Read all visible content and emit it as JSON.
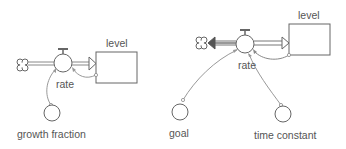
{
  "colors": {
    "stroke": "#666666",
    "flow_pipe": "#888888",
    "outflow_pipe": "#777777",
    "connector": "#999999",
    "text": "#555555",
    "background": "#ffffff"
  },
  "models": [
    {
      "name": "exponential growth",
      "stock": {
        "label": "level"
      },
      "flow": {
        "label": "rate",
        "direction": "inflow",
        "source": "cloud"
      },
      "auxiliaries": [
        {
          "label": "growth fraction"
        }
      ],
      "links": [
        "level -> rate",
        "growth fraction -> rate"
      ]
    },
    {
      "name": "goal seeking",
      "stock": {
        "label": "level"
      },
      "flow": {
        "label": "rate",
        "direction": "biflow",
        "sink": "cloud"
      },
      "auxiliaries": [
        {
          "label": "goal"
        },
        {
          "label": "time constant"
        }
      ],
      "links": [
        "level -> rate",
        "goal -> rate",
        "time constant -> rate"
      ]
    }
  ]
}
